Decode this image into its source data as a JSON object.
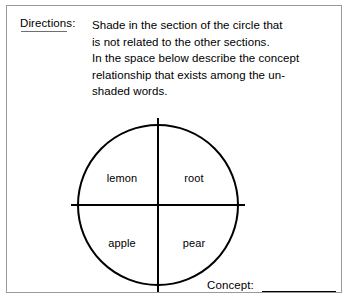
{
  "worksheet": {
    "directions": {
      "label": "Directions:",
      "lines": [
        "Shade in the section of the circle that",
        "is not related to the other sections.",
        "In the space below describe the concept",
        "relationship that exists among the un-",
        "shaded words."
      ]
    },
    "diagram": {
      "shape": "circle-quartered",
      "quadrants": [
        {
          "position": "top-left",
          "label": "lemon"
        },
        {
          "position": "top-right",
          "label": "root"
        },
        {
          "position": "bottom-left",
          "label": "apple"
        },
        {
          "position": "bottom-right",
          "label": "pear"
        }
      ]
    },
    "answer": {
      "label": "Concept:",
      "value": ""
    },
    "colors": {
      "ink": "#000000",
      "frame": "#9a9a9a",
      "paper": "#ffffff"
    }
  }
}
